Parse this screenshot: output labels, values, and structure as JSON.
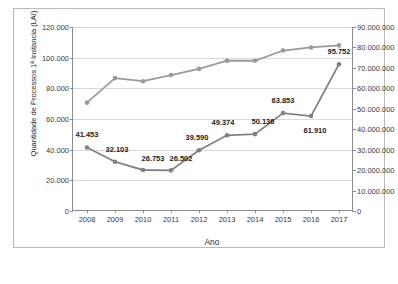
{
  "chart_data": {
    "type": "line",
    "title": "",
    "xlabel": "Ano",
    "ylabel_left": "Quantidade de Processos 1ª Instancia (LAI)",
    "ylabel_right": "Quantidade de Processos 1ª Instancia (Justiça em Números)",
    "categories": [
      "2008",
      "2009",
      "2010",
      "2011",
      "2012",
      "2013",
      "2014",
      "2015",
      "2016",
      "2017"
    ],
    "ylim_left": [
      0,
      120000
    ],
    "ylim_right": [
      0,
      90000000
    ],
    "yticks_left": [
      "0",
      "20.000",
      "40.000",
      "60.000",
      "80.000",
      "100.000",
      "120.000"
    ],
    "yticks_right": [
      "0",
      "10.000.000",
      "20.000.000",
      "30.000.000",
      "40.000.000",
      "50.000.000",
      "60.000.000",
      "70.000.000",
      "80.000.000",
      "90.000.000"
    ],
    "grid": true,
    "legend": "none",
    "series": [
      {
        "name": "Quantidade de Processos 1ª Instancia (LAI)",
        "axis": "left",
        "color": "#808080",
        "values": [
          41453,
          32103,
          26753,
          26502,
          39590,
          49374,
          50136,
          63853,
          61910,
          95752
        ],
        "labels": [
          "41.453",
          "32.103",
          "26.753",
          "26.502",
          "39.590",
          "49.374",
          "50.136",
          "63.853",
          "61.910",
          "95.752"
        ]
      },
      {
        "name": "Quantidade de Processos 1ª Instancia (Justiça em Números)",
        "axis": "right",
        "color": "#9a9a9a",
        "values": [
          53000000,
          65000000,
          63500000,
          66500000,
          69500000,
          73500000,
          73500000,
          78500000,
          80000000,
          81000000
        ],
        "labels": []
      }
    ]
  }
}
